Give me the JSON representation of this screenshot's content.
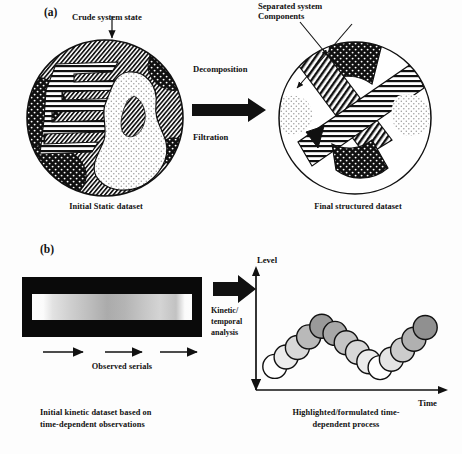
{
  "figure": {
    "panels": [
      {
        "tag": "(a)",
        "top_label": "Crude system state",
        "right_top_label_line1": "Separated system",
        "right_top_label_line2": "Components",
        "process_top": "Decomposition",
        "process_bottom": "Filtration",
        "left_caption": "Initial Static dataset",
        "right_caption": "Final structured dataset"
      },
      {
        "tag": "(b)",
        "arrow_label_line1": "Kinetic/",
        "arrow_label_line2": "temporal",
        "arrow_label_line3": "analysis",
        "serials_label": "Observed serials",
        "axis_y": "Level",
        "axis_x": "Time",
        "left_caption_line1": "Initial kinetic dataset based on",
        "left_caption_line2": "time-dependent observations",
        "right_caption_line1": "Highlighted/formulated time-",
        "right_caption_line2": "dependent process"
      }
    ]
  },
  "chart_data": {
    "type": "scatter",
    "xlabel": "Time",
    "ylabel": "Level",
    "grid": false,
    "legend": "none",
    "note": "Chain of overlapping circles forming a V / zig-zag; fill darkens as level rises",
    "xlim": [
      0,
      10
    ],
    "ylim": [
      0,
      10
    ],
    "series": [
      {
        "name": "kinetic-chain",
        "points": [
          {
            "x": 1.0,
            "y": 2.0,
            "shade": "#ffffff"
          },
          {
            "x": 1.6,
            "y": 2.8,
            "shade": "#ececec"
          },
          {
            "x": 2.2,
            "y": 3.6,
            "shade": "#d8d8d8"
          },
          {
            "x": 2.8,
            "y": 4.5,
            "shade": "#b9b9b9"
          },
          {
            "x": 3.5,
            "y": 5.4,
            "shade": "#9a9a9a"
          },
          {
            "x": 4.2,
            "y": 4.8,
            "shade": "#a8a8a8"
          },
          {
            "x": 4.8,
            "y": 4.0,
            "shade": "#c4c4c4"
          },
          {
            "x": 5.4,
            "y": 3.2,
            "shade": "#d8d8d8"
          },
          {
            "x": 6.0,
            "y": 2.4,
            "shade": "#ececec"
          },
          {
            "x": 6.6,
            "y": 1.9,
            "shade": "#ffffff"
          },
          {
            "x": 7.2,
            "y": 2.6,
            "shade": "#e4e4e4"
          },
          {
            "x": 7.8,
            "y": 3.4,
            "shade": "#cccccc"
          },
          {
            "x": 8.4,
            "y": 4.3,
            "shade": "#b0b0b0"
          },
          {
            "x": 9.0,
            "y": 5.3,
            "shade": "#909090"
          }
        ]
      }
    ]
  },
  "gel": {
    "name": "initial-kinetic-gel-image",
    "background": "#0a0a0a",
    "band_stops": [
      "#fdfdfd",
      "#e6e6e6",
      "#c9c9c9",
      "#b4b4b4",
      "#a8a8a8",
      "#bdbdbd",
      "#cfcfcf",
      "#d6d6d6",
      "#fbfbfb"
    ],
    "arrow_count": 3
  },
  "colors": {
    "ink": "#111111",
    "fill_black": "#101010",
    "fill_white": "#ffffff",
    "stipple_light": "#f2f2f2"
  }
}
